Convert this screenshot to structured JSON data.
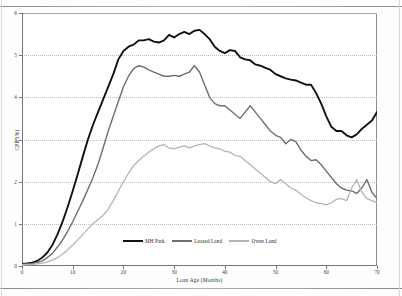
{
  "figure": {
    "ylabel": "CPR (%)",
    "xlabel": "Loan Age (Months)"
  },
  "legend": {
    "items": [
      {
        "label": "MH Park",
        "color": "#111111"
      },
      {
        "label": "Leased Land",
        "color": "#6e6e6e"
      },
      {
        "label": "Owns Land",
        "color": "#b4b4b4"
      }
    ]
  },
  "chart_data": {
    "type": "line",
    "title": "",
    "xlabel": "Loan Age (Months)",
    "ylabel": "CPR (%)",
    "xlim": [
      0,
      70
    ],
    "ylim": [
      0,
      6
    ],
    "xticks": [
      0,
      10,
      20,
      30,
      40,
      50,
      60,
      70
    ],
    "yticks": [
      0,
      1,
      2,
      3,
      4,
      5,
      6
    ],
    "grid": "horizontal-dotted",
    "legend_position": "bottom-center",
    "x": [
      0,
      1,
      2,
      3,
      4,
      5,
      6,
      7,
      8,
      9,
      10,
      11,
      12,
      13,
      14,
      15,
      16,
      17,
      18,
      19,
      20,
      21,
      22,
      23,
      24,
      25,
      26,
      27,
      28,
      29,
      30,
      31,
      32,
      33,
      34,
      35,
      36,
      37,
      38,
      39,
      40,
      41,
      42,
      43,
      44,
      45,
      46,
      47,
      48,
      49,
      50,
      51,
      52,
      53,
      54,
      55,
      56,
      57,
      58,
      59,
      60,
      61,
      62,
      63,
      64,
      65,
      66,
      67,
      68,
      69,
      70
    ],
    "series": [
      {
        "name": "MH Park",
        "color": "#111111",
        "values": [
          0.05,
          0.06,
          0.08,
          0.12,
          0.2,
          0.32,
          0.5,
          0.75,
          1.05,
          1.4,
          1.78,
          2.18,
          2.6,
          3.0,
          3.35,
          3.65,
          3.95,
          4.25,
          4.55,
          4.9,
          5.1,
          5.2,
          5.25,
          5.35,
          5.35,
          5.38,
          5.32,
          5.3,
          5.35,
          5.48,
          5.42,
          5.5,
          5.55,
          5.5,
          5.58,
          5.6,
          5.5,
          5.38,
          5.2,
          5.1,
          5.05,
          5.12,
          5.1,
          4.95,
          4.9,
          4.88,
          4.78,
          4.75,
          4.7,
          4.65,
          4.55,
          4.5,
          4.45,
          4.42,
          4.4,
          4.35,
          4.3,
          4.3,
          4.1,
          3.85,
          3.55,
          3.3,
          3.2,
          3.2,
          3.1,
          3.05,
          3.12,
          3.25,
          3.35,
          3.45,
          3.65
        ]
      },
      {
        "name": "Leased Land",
        "color": "#6e6e6e",
        "values": [
          0.04,
          0.05,
          0.06,
          0.08,
          0.12,
          0.2,
          0.3,
          0.45,
          0.62,
          0.82,
          1.05,
          1.3,
          1.55,
          1.82,
          2.1,
          2.42,
          2.8,
          3.2,
          3.55,
          3.9,
          4.25,
          4.5,
          4.68,
          4.75,
          4.72,
          4.65,
          4.6,
          4.55,
          4.5,
          4.5,
          4.52,
          4.5,
          4.55,
          4.6,
          4.75,
          4.6,
          4.3,
          4.0,
          3.85,
          3.8,
          3.8,
          3.7,
          3.6,
          3.5,
          3.65,
          3.8,
          3.65,
          3.5,
          3.35,
          3.2,
          3.1,
          3.05,
          2.9,
          3.0,
          2.95,
          2.75,
          2.6,
          2.5,
          2.52,
          2.4,
          2.25,
          2.1,
          1.95,
          1.85,
          1.8,
          1.78,
          1.72,
          1.85,
          2.05,
          1.75,
          1.6
        ]
      },
      {
        "name": "Owns Land",
        "color": "#b4b4b4",
        "values": [
          0.03,
          0.03,
          0.04,
          0.05,
          0.07,
          0.1,
          0.14,
          0.2,
          0.28,
          0.38,
          0.5,
          0.62,
          0.75,
          0.88,
          1.0,
          1.1,
          1.2,
          1.35,
          1.55,
          1.78,
          2.0,
          2.2,
          2.38,
          2.5,
          2.6,
          2.7,
          2.78,
          2.85,
          2.88,
          2.8,
          2.78,
          2.82,
          2.85,
          2.8,
          2.85,
          2.88,
          2.9,
          2.85,
          2.8,
          2.78,
          2.72,
          2.7,
          2.62,
          2.6,
          2.5,
          2.4,
          2.3,
          2.2,
          2.1,
          2.0,
          1.95,
          2.05,
          1.95,
          1.85,
          1.8,
          1.7,
          1.62,
          1.55,
          1.5,
          1.48,
          1.45,
          1.5,
          1.58,
          1.6,
          1.55,
          1.85,
          2.05,
          1.75,
          1.6,
          1.55,
          1.5
        ]
      }
    ]
  }
}
